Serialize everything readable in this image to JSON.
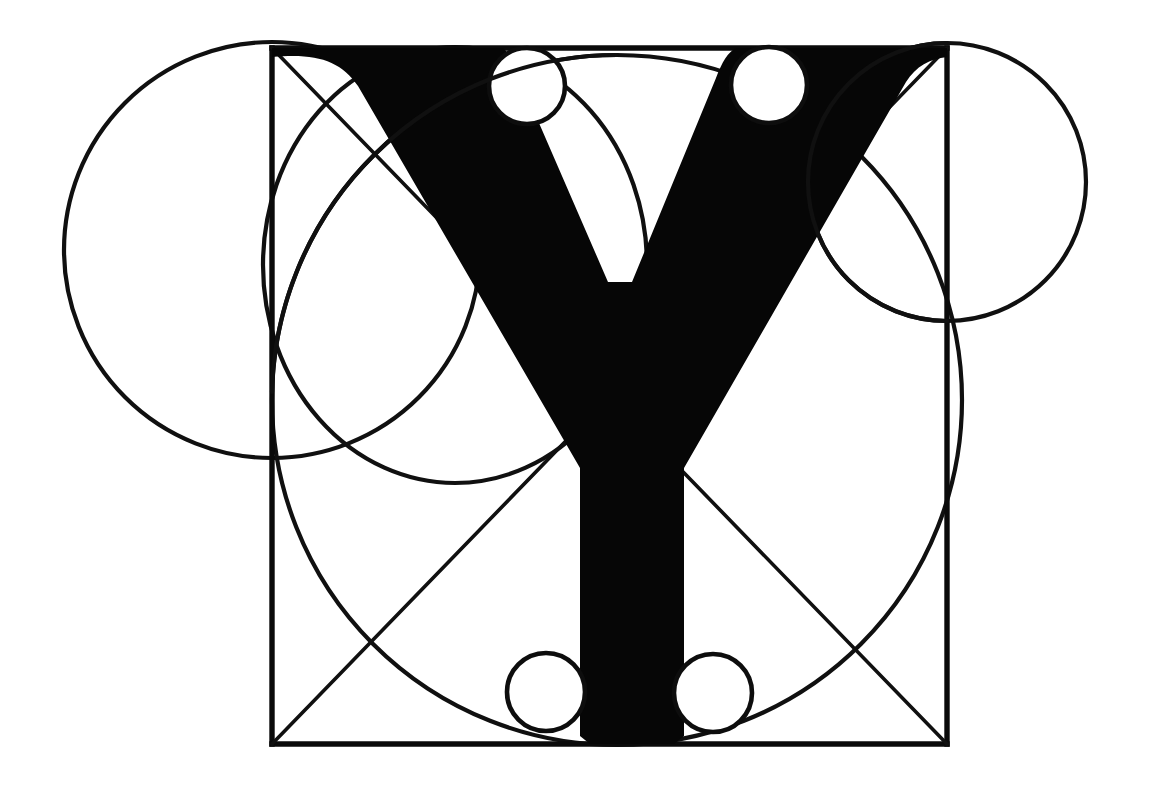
{
  "figure": {
    "title": "Geometric construction of the capital letter Y",
    "letter": "Y",
    "background_color": "#ffffff",
    "ink_color": "#0a0a0a",
    "canvas": {
      "width": 1152,
      "height": 808
    }
  },
  "construction": {
    "square": {
      "name": "bounding-square",
      "left": 272,
      "top": 48,
      "right": 947,
      "bottom": 744,
      "width": 675,
      "height": 696
    },
    "diagonals": [
      {
        "name": "diagonal-top-left-to-bottom-right",
        "x1": 272,
        "y1": 48,
        "x2": 947,
        "y2": 744
      },
      {
        "name": "diagonal-bottom-left-to-top-right",
        "x1": 272,
        "y1": 744,
        "x2": 947,
        "y2": 48
      }
    ],
    "outer_circles": [
      {
        "name": "left-outer-circle",
        "cx": 272,
        "cy": 250,
        "r": 208
      },
      {
        "name": "right-outer-circle",
        "cx": 947,
        "cy": 182,
        "r": 139
      }
    ],
    "inner_arcs": [
      {
        "name": "upper-left-inner-circle",
        "cx": 455,
        "cy": 265,
        "rx": 192,
        "ry": 218
      },
      {
        "name": "large-inscribed-circle",
        "cx": 617,
        "cy": 400,
        "rx": 345,
        "ry": 345
      }
    ],
    "small_circles": [
      {
        "name": "small-circle-top-left",
        "cx": 527,
        "cy": 86,
        "r": 38
      },
      {
        "name": "small-circle-top-right",
        "cx": 769,
        "cy": 85,
        "r": 38
      },
      {
        "name": "small-circle-bottom-left",
        "cx": 546,
        "cy": 692,
        "r": 39
      },
      {
        "name": "small-circle-bottom-right",
        "cx": 713,
        "cy": 693,
        "r": 39
      }
    ]
  },
  "glyph": {
    "name": "letter-y-solid",
    "description": "Solid black serif capital Y spanning the construction square",
    "stem": {
      "left": 590,
      "right": 674,
      "top": 310,
      "bottom": 744
    },
    "junction_y": 310,
    "left_arm_top": {
      "x1": 272,
      "x2": 503
    },
    "right_arm_top": {
      "x1": 740,
      "x2": 947
    }
  }
}
